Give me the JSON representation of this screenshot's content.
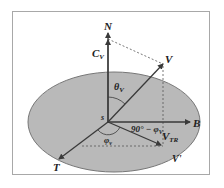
{
  "diagram": {
    "colors": {
      "ellipse_fill": "#b9b9b9",
      "ellipse_stroke": "#777777",
      "vector": "#3a3a3a",
      "dashed": "#555555",
      "frame": "#a8a8a8"
    },
    "labels": {
      "N": "N",
      "Cv": "C",
      "Cv_sub": "V",
      "V": "V",
      "theta": "θ",
      "theta_sub": "V",
      "s": "s",
      "B": "B",
      "angle_complement": "90° − φ",
      "angle_complement_sub": "V",
      "VTR": "V",
      "VTR_sub": "TR",
      "phi": "φ",
      "phi_sub": "v",
      "T": "T",
      "Vprime": "V'"
    }
  }
}
